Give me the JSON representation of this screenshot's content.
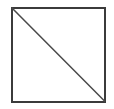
{
  "figure": {
    "canvas": {
      "width": 114,
      "height": 109,
      "background_color": "#ffffff"
    },
    "shapes": [
      {
        "name": "square-outline",
        "type": "rectangle",
        "x": 11.5,
        "y": 7.5,
        "width": 93,
        "height": 94,
        "stroke_color": "#3b3b3b",
        "stroke_width": 2,
        "fill": "none"
      },
      {
        "name": "diagonal-line",
        "type": "line",
        "x1": 12,
        "y1": 8,
        "x2": 104.5,
        "y2": 101,
        "stroke_color": "#4a4a4a",
        "stroke_width": 1.5,
        "direction": "top-left-to-bottom-right"
      }
    ],
    "labels": []
  }
}
